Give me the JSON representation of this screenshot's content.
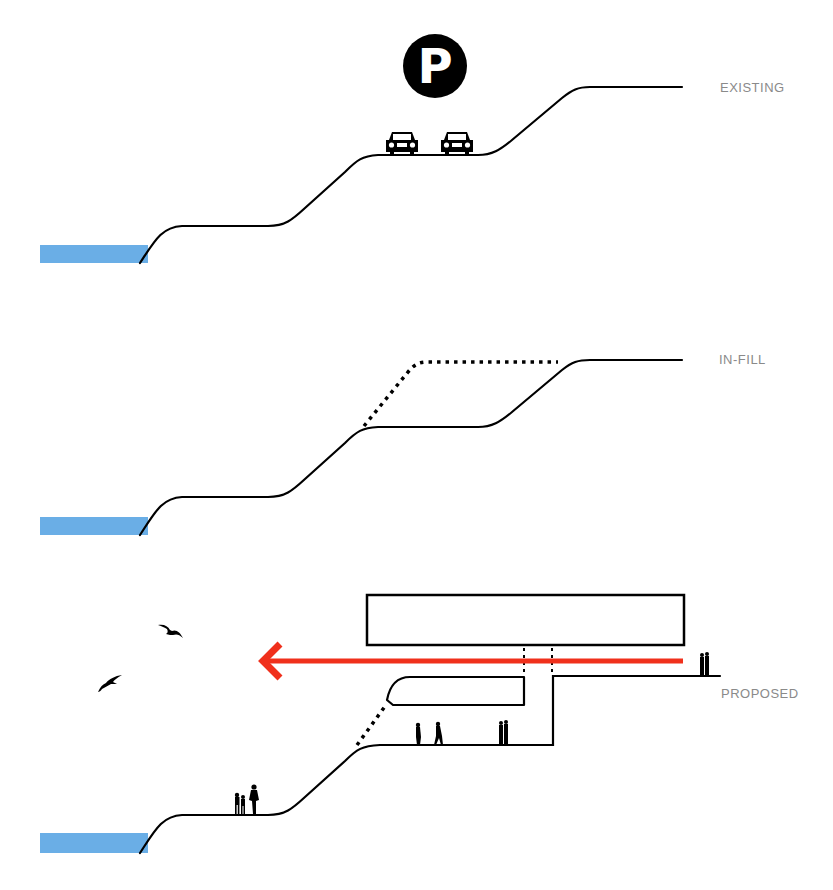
{
  "diagram": {
    "colors": {
      "water": "#6aaee6",
      "line": "#000000",
      "arrow": "#f0301c",
      "label": "#8a8a8a"
    },
    "panels": [
      {
        "id": "existing",
        "label": "EXISTING",
        "elements": [
          "water",
          "terraced-ground-profile",
          "parking-sign",
          "car",
          "car"
        ]
      },
      {
        "id": "in-fill",
        "label": "IN-FILL",
        "elements": [
          "water",
          "terraced-ground-profile",
          "dotted-infill-outline"
        ]
      },
      {
        "id": "proposed",
        "label": "PROPOSED",
        "elements": [
          "water",
          "terraced-ground-profile",
          "building-slab",
          "red-circulation-arrow",
          "underpass",
          "birds",
          "people"
        ]
      }
    ],
    "parking_sign": {
      "glyph": "P"
    }
  }
}
